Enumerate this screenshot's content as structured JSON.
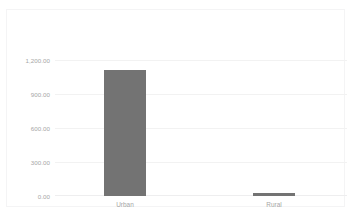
{
  "chart_data": {
    "type": "bar",
    "title": "",
    "subtitle": "",
    "xlabel": "",
    "ylabel": "",
    "categories": [
      "Urban",
      "Rural"
    ],
    "values": [
      1110,
      25
    ],
    "series": [
      {
        "name": "",
        "values": [
          1110,
          25
        ],
        "color": "#737373"
      }
    ],
    "ylim": [
      0,
      1200
    ],
    "yticks": [
      0,
      300,
      600,
      900,
      1200
    ],
    "ytick_labels": [
      "0.00",
      "300.00",
      "600.00",
      "900.00",
      "1,200.00"
    ],
    "gridlines": "horizontal",
    "legend": "none",
    "colors": {
      "bar": "#737373",
      "gridline": "#f2f2f2",
      "border": "#f4f4f5",
      "tick_text": "#a6a6a6",
      "background": "#ffffff"
    }
  }
}
